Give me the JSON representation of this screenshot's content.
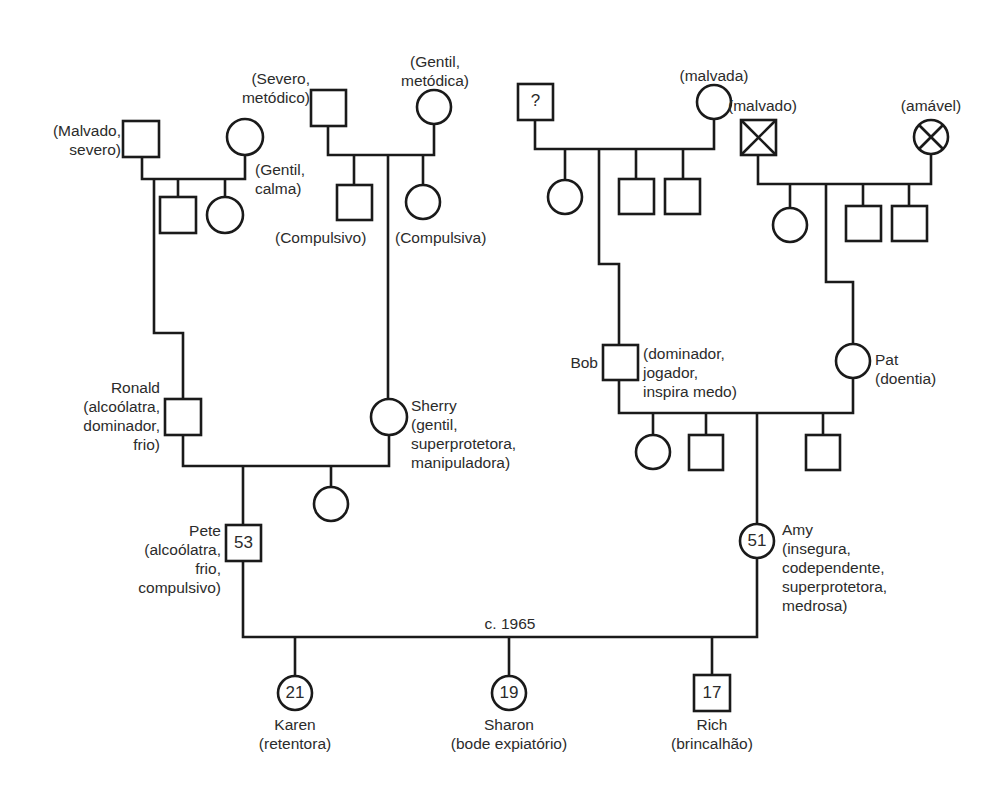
{
  "diagram": {
    "type": "genogram",
    "gen1": {
      "malvado_severo": {
        "label": "(Malvado,\nsevero)",
        "sex": "male"
      },
      "gentil_calma": {
        "label": "(Gentil,\ncalma)",
        "sex": "female"
      },
      "severo_metodico": {
        "label": "(Severo,\nmetódico)",
        "sex": "male"
      },
      "gentil_metodica": {
        "label": "(Gentil,\nmetódica)",
        "sex": "female"
      },
      "unknown_father": {
        "label": "",
        "inner": "?",
        "sex": "male"
      },
      "malvada": {
        "label": "(malvada)",
        "sex": "female"
      },
      "malvado_deceased": {
        "label": "(malvado)",
        "sex": "male",
        "deceased": true
      },
      "amavel_deceased": {
        "label": "(amável)",
        "sex": "female",
        "deceased": true
      }
    },
    "gen2_siblings": {
      "compulsivo": "(Compulsivo)",
      "compulsiva": "(Compulsiva)"
    },
    "gen2": {
      "ronald": {
        "label": "Ronald\n(alcoólatra,\ndominador,\nfrio)",
        "sex": "male"
      },
      "sherry": {
        "label": "Sherry\n(gentil,\nsuperprotetora,\nmanipuladora)",
        "sex": "female"
      },
      "bob": {
        "name": "Bob",
        "traits": "(dominador,\njogador,\ninspira medo)",
        "sex": "male"
      },
      "pat": {
        "label": "Pat\n(doentia)",
        "sex": "female"
      }
    },
    "gen3": {
      "pete": {
        "label": "Pete\n(alcoólatra,\nfrio,\ncompulsivo)",
        "age": "53",
        "sex": "male"
      },
      "amy": {
        "label": "Amy\n(insegura,\ncodependente,\nsuperprotetora,\nmedrosa)",
        "age": "51",
        "sex": "female"
      }
    },
    "marriage": {
      "label": "c. 1965"
    },
    "gen4": [
      {
        "name": "Karen",
        "role": "(retentora)",
        "age": "21",
        "sex": "female"
      },
      {
        "name": "Sharon",
        "role": "(bode expiatório)",
        "age": "19",
        "sex": "female"
      },
      {
        "name": "Rich",
        "role": "(brincalhão)",
        "age": "17",
        "sex": "male"
      }
    ]
  }
}
